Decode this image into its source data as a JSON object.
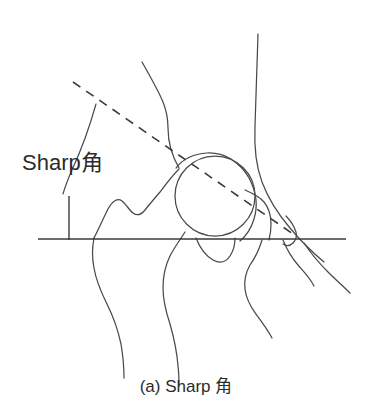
{
  "figure": {
    "type": "medical-line-drawing",
    "background_color": "#ffffff",
    "line_color": "#4a4a4a",
    "text_color": "#2b2b2b",
    "angle_label": "Sharp角",
    "caption": "(a) Sharp 角",
    "annotations": {
      "horizontal_reference_line": "horizontal pelvic reference line",
      "vertical_line": "vertical reference line at angle vertex",
      "dashed_line": "dashed line from vertex to acetabular edge",
      "arc": "angle arc marker between vertical and dashed line"
    },
    "geometry": {
      "horizontal_line_y": 239,
      "horizontal_line_x_start": 38,
      "horizontal_line_x_end": 346,
      "vertical_line_x": 69,
      "vertical_line_y_top": 196,
      "vertical_line_y_bottom": 239,
      "dashed_start": [
        73,
        82
      ],
      "dashed_end": [
        296,
        236
      ],
      "femoral_head_center": [
        215,
        196
      ],
      "femoral_head_radius": 40
    }
  }
}
